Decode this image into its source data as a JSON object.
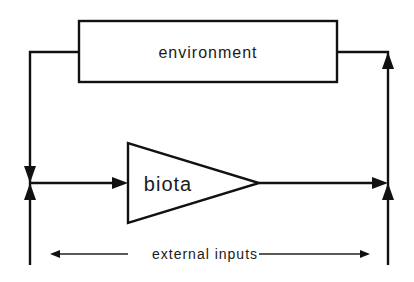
{
  "diagram": {
    "type": "feedback-block-diagram",
    "nodes": {
      "environment": {
        "label": "environment",
        "shape": "rectangle"
      },
      "biota": {
        "label": "biota",
        "shape": "triangle"
      }
    },
    "annotation": {
      "label": "external inputs"
    },
    "edges": [
      {
        "from": "environment",
        "to": "left-junction",
        "description": "environment output loops left and down into junction"
      },
      {
        "from": "left-junction",
        "to": "biota",
        "description": "junction feeds biota"
      },
      {
        "from": "external-inputs-left",
        "to": "left-junction",
        "description": "external input enters left junction from below"
      },
      {
        "from": "biota",
        "to": "right-junction",
        "description": "biota output to right junction"
      },
      {
        "from": "external-inputs-right",
        "to": "right-junction",
        "description": "external input enters right junction from below"
      },
      {
        "from": "right-junction",
        "to": "environment",
        "description": "right junction feeds back up into environment"
      }
    ],
    "colors": {
      "stroke": "#111111",
      "background": "#ffffff"
    }
  }
}
